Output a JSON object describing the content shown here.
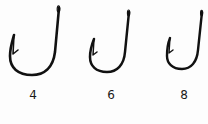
{
  "figure": {
    "ink_color": "#111111",
    "background": "#fdfdfd",
    "hooks": [
      {
        "size_label": "4",
        "label_x": 33,
        "label_y": 89
      },
      {
        "size_label": "6",
        "label_x": 111,
        "label_y": 89
      },
      {
        "size_label": "8",
        "label_x": 184,
        "label_y": 89
      }
    ]
  }
}
